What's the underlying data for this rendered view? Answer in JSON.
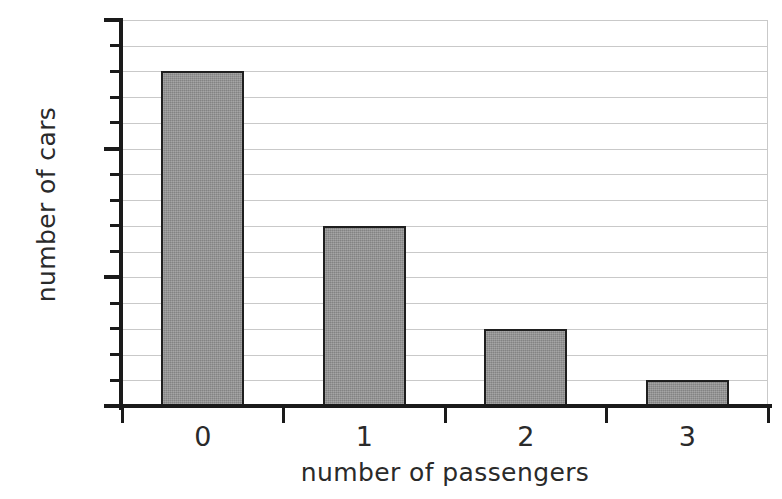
{
  "chart_data": {
    "type": "bar",
    "title": "",
    "xlabel": "number of passengers",
    "ylabel": "number of cars",
    "categories": [
      "0",
      "1",
      "2",
      "3"
    ],
    "values": [
      26,
      14,
      6,
      2
    ],
    "ylim": [
      0,
      30
    ],
    "y_major_ticks": [
      0,
      10,
      20,
      30
    ],
    "y_minor_tick_step": 2,
    "y_tick_labels": [
      "0",
      "10",
      "20",
      "30"
    ],
    "grid": true,
    "legend": null,
    "bar_fill_color": "#919191",
    "bar_border_color": "#1f1f1f",
    "gridline_color": "#c9c9c9",
    "axis_color": "#1a1a1a"
  }
}
